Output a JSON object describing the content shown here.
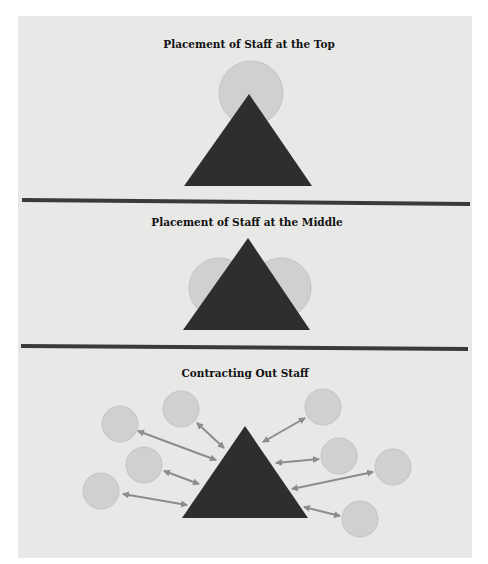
{
  "colors": {
    "page_background": "#ffffff",
    "panel_background": "#e8e8e6",
    "triangle_fill": "#2e2e2e",
    "circle_fill": "#d0d0cf",
    "circle_stroke": "#c3c3c2",
    "divider": "#3a3a3a",
    "arrow": "#8c8c8c"
  },
  "sections": [
    {
      "title": "Placement of Staff at the Top",
      "description": "Single staff circle positioned behind the apex of the organizational pyramid",
      "triangle": {
        "apex": [
          249,
          94
        ],
        "base_left": [
          184,
          186
        ],
        "base_right": [
          312,
          186
        ]
      },
      "circles": [
        {
          "cx": 251,
          "cy": 93,
          "r": 32
        }
      ]
    },
    {
      "title": "Placement of Staff at the Middle",
      "description": "Two staff circles positioned behind the middle of the organizational pyramid",
      "triangle": {
        "apex": [
          248,
          238
        ],
        "base_left": [
          183,
          330
        ],
        "base_right": [
          310,
          330
        ]
      },
      "circles": [
        {
          "cx": 219,
          "cy": 288,
          "r": 30
        },
        {
          "cx": 281,
          "cy": 288,
          "r": 30
        }
      ]
    },
    {
      "title": "Contracting Out Staff",
      "description": "Eight external staff circles connected to the organizational pyramid by double-headed arrows",
      "triangle": {
        "apex": [
          245,
          426
        ],
        "base_left": [
          182,
          518
        ],
        "base_right": [
          308,
          518
        ]
      },
      "circles": [
        {
          "cx": 120,
          "cy": 424,
          "r": 18
        },
        {
          "cx": 181,
          "cy": 409,
          "r": 18
        },
        {
          "cx": 144,
          "cy": 465,
          "r": 18
        },
        {
          "cx": 101,
          "cy": 491,
          "r": 18
        },
        {
          "cx": 323,
          "cy": 407,
          "r": 18
        },
        {
          "cx": 339,
          "cy": 456,
          "r": 18
        },
        {
          "cx": 393,
          "cy": 467,
          "r": 18
        },
        {
          "cx": 360,
          "cy": 519,
          "r": 18
        }
      ],
      "arrows": [
        {
          "from": [
            138,
            431
          ],
          "to": [
            216,
            460
          ]
        },
        {
          "from": [
            197,
            423
          ],
          "to": [
            224,
            448
          ]
        },
        {
          "from": [
            164,
            471
          ],
          "to": [
            199,
            484
          ]
        },
        {
          "from": [
            123,
            494
          ],
          "to": [
            187,
            505
          ]
        },
        {
          "from": [
            305,
            418
          ],
          "to": [
            263,
            442
          ]
        },
        {
          "from": [
            319,
            459
          ],
          "to": [
            276,
            463
          ]
        },
        {
          "from": [
            373,
            472
          ],
          "to": [
            292,
            489
          ]
        },
        {
          "from": [
            340,
            516
          ],
          "to": [
            304,
            507
          ]
        }
      ]
    }
  ],
  "dividers": [
    {
      "x1": 22,
      "y1": 200,
      "x2": 470,
      "y2": 204
    },
    {
      "x1": 21,
      "y1": 346,
      "x2": 468,
      "y2": 349
    }
  ]
}
